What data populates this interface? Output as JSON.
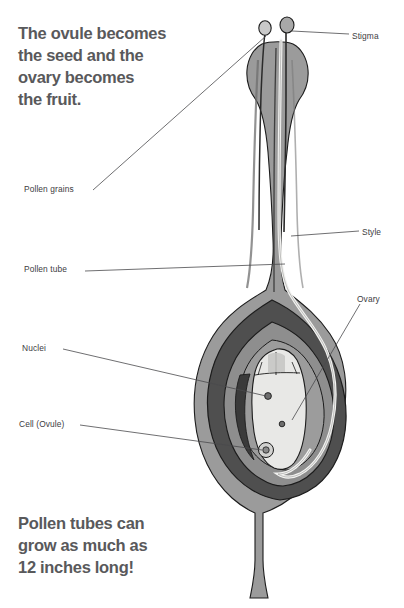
{
  "page": {
    "background_color": "#ffffff",
    "width": 404,
    "height": 608
  },
  "headings": {
    "top": "The ovule becomes\nthe seed and the\novary becomes\nthe fruit.",
    "bottom": "Pollen tubes can\ngrow as much as\n12 inches long!"
  },
  "labels": {
    "stigma": "Stigma",
    "style": "Style",
    "ovary": "Ovary",
    "pollen_grains": "Pollen grains",
    "pollen_tube": "Pollen tube",
    "nuclei": "Nuclei",
    "cell_ovule": "Cell (Ovule)"
  },
  "colors": {
    "heading_text": "#59595b",
    "label_text": "#3d3d3f",
    "leader_line": "#4a4a4c",
    "outline": "#1c1c1c",
    "pistil_outer": "#9b9b9b",
    "ovary_wall_dark": "#4f4f4f",
    "ovary_inner_mid": "#8e8e8e",
    "ovule_pale": "#e8e8e6",
    "nucleus_dot": "#6d6d6d",
    "pollen_tube_pale": "#f2f2f0",
    "stigma_knob": "#c9c9c9"
  },
  "structures": [
    {
      "name": "stigma",
      "description": "two rounded knobs on slender stalks at apex of pistil"
    },
    {
      "name": "anther-body",
      "description": "bulbous shaded head beneath the stigma lobes"
    },
    {
      "name": "style",
      "description": "long tapering column connecting stigma to ovary"
    },
    {
      "name": "ovary",
      "description": "teardrop shaped chamber with concentric wall layers"
    },
    {
      "name": "ovule",
      "description": "pale oval embryo sac inside the ovary"
    },
    {
      "name": "nuclei",
      "description": "three dark dots within the ovule"
    },
    {
      "name": "pollen-tube",
      "description": "pale line running from stigma down through style into ovary"
    },
    {
      "name": "pedicel",
      "description": "stalk below the ovary"
    }
  ]
}
